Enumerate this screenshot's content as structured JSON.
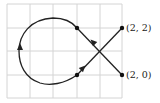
{
  "diagram": {
    "type": "parametric-curve-on-grid",
    "grid": {
      "cols": 5,
      "rows": 4,
      "color": "#d4d4d4"
    },
    "curve_color": "#222222",
    "points": [
      {
        "label": "(2, 2)",
        "role": "start"
      },
      {
        "label": "(2, 0)",
        "role": "end"
      }
    ],
    "arrows": 3
  }
}
